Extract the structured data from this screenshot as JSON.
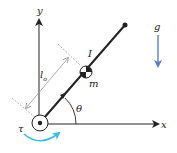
{
  "diagram": {
    "labels": {
      "y_axis": "y",
      "x_axis": "x",
      "inertia": "I",
      "mass": "m",
      "length": "l",
      "length_subscript": "o",
      "angle": "θ",
      "gravity": "g",
      "torque": "τ"
    },
    "colors": {
      "line": "#222222",
      "gravity_arrow": "#5b7fbf",
      "torque_arrow": "#3bbde0",
      "dimension": "#999999"
    }
  }
}
